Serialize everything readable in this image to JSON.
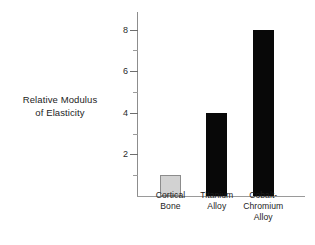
{
  "chart_data": {
    "type": "bar",
    "title": "",
    "xlabel": "",
    "ylabel": "Relative Modulus of Elasticity",
    "ylabel_lines": [
      "Relative Modulus",
      "of Elasticity"
    ],
    "categories": [
      "Cortical Bone",
      "Titanium Alloy",
      "Cobalt-Chromium Alloy"
    ],
    "category_lines": [
      [
        "Cortical",
        "Bone"
      ],
      [
        "Titanium",
        "Alloy"
      ],
      [
        "Cobalt-",
        "Chromium",
        "Alloy"
      ]
    ],
    "values": [
      1,
      4,
      8
    ],
    "bar_colors": [
      "#d2d2d2",
      "#080808",
      "#080808"
    ],
    "bar_edge_colors": [
      "#8c8c8c",
      "#080808",
      "#080808"
    ],
    "ylim": [
      0,
      8.85
    ],
    "xlim": [
      0,
      3.6
    ],
    "y_major_ticks": [
      2,
      4,
      6,
      8
    ],
    "y_minor_ticks": [
      1,
      3,
      5,
      7
    ],
    "y_tick_labels": [
      "2",
      "4",
      "6",
      "8"
    ],
    "grid": false,
    "legend": null,
    "legend_position": "none",
    "axis_color": "#8d8d8d",
    "text_color": "#1d1d1d"
  }
}
